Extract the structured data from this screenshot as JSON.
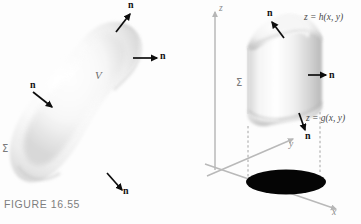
{
  "figure": {
    "caption": "FIGURE 16.55",
    "domain": "mathematics-textbook-figure",
    "panels": [
      {
        "id": "left-panel",
        "name": "closed-surface-volume",
        "labels": {
          "volume": "V",
          "surface": "Σ"
        },
        "normals": [
          {
            "id": "n-top",
            "label": "n",
            "label_x": 130,
            "label_y": 4,
            "tail_x": 116,
            "tail_y": 32,
            "head_x": 130,
            "head_y": 14
          },
          {
            "id": "n-upper-right",
            "label": "n",
            "label_x": 162,
            "label_y": 52,
            "tail_x": 133,
            "tail_y": 58,
            "head_x": 157,
            "head_y": 58
          },
          {
            "id": "n-left",
            "label": "n",
            "label_x": 32,
            "label_y": 83,
            "tail_x": 33,
            "tail_y": 92,
            "head_x": 52,
            "head_y": 107
          },
          {
            "id": "n-bottom",
            "label": "n",
            "label_x": 124,
            "label_y": 188,
            "tail_x": 107,
            "tail_y": 173,
            "head_x": 122,
            "head_y": 190
          }
        ]
      },
      {
        "id": "right-panel",
        "name": "region-between-two-surfaces",
        "axes": [
          {
            "id": "axis-z",
            "label": "z",
            "label_x": 218,
            "label_y": 5
          },
          {
            "id": "axis-y",
            "label": "y",
            "label_x": 290,
            "label_y": 144
          },
          {
            "id": "axis-x",
            "label": "x",
            "label_x": 333,
            "label_y": 212
          }
        ],
        "labels": {
          "surface": "Σ",
          "top_surface_equation": "z = h(x, y)",
          "bottom_surface_equation": "z = g(x, y)"
        },
        "normals": [
          {
            "id": "n-top",
            "label": "n",
            "label_x": 269,
            "label_y": 12,
            "tail_x": 284,
            "tail_y": 38,
            "head_x": 272,
            "head_y": 22
          },
          {
            "id": "n-side",
            "label": "n",
            "label_x": 331,
            "label_y": 69,
            "tail_x": 308,
            "tail_y": 75,
            "head_x": 326,
            "head_y": 75
          },
          {
            "id": "n-bottom",
            "label": "n",
            "label_x": 307,
            "label_y": 133,
            "tail_x": 299,
            "tail_y": 113,
            "head_x": 305,
            "head_y": 130
          }
        ]
      }
    ],
    "colors": {
      "ink": "#111111",
      "axis": "#b6b6b6",
      "label_gray": "#7a7a7a",
      "shadow": "#000000",
      "surface_light": "#f2f2f2",
      "surface_shade": "#bdbdbd",
      "background": "#fdfdfd"
    }
  }
}
